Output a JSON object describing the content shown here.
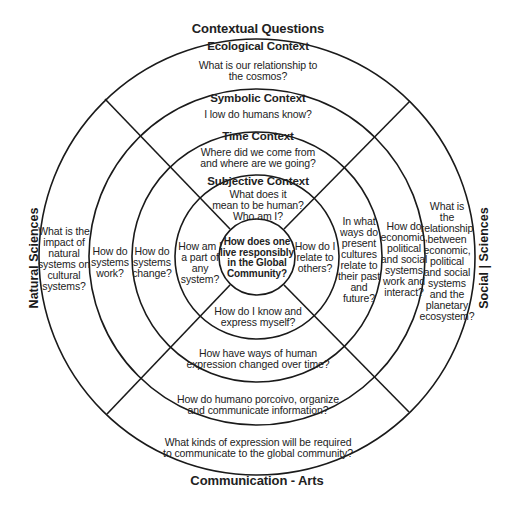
{
  "diagram": {
    "outer_labels": {
      "top": "Contextual Questions",
      "bottom": "Communication - Arts",
      "left": "Natural Sciences",
      "right": "Social | Sciences"
    },
    "rings": {
      "ecological": {
        "title": "Ecological Context",
        "top_question": "What is our relationship to\nthe cosmos?",
        "left_question": "What is the\nimpact of\nnatural\nsystems on\ncultural\nsystems?",
        "right_question": "What is\nthe\nrelationship\nbetween\neconomic,\npolitical\nand social\nsystems\nand the\nplanetary\necosystem?",
        "bottom_question": "What kinds of expression will be required\nto communicate to the global community?"
      },
      "symbolic": {
        "title": "Symbolic Context",
        "top_question": "I low do humans know?",
        "left_question": "How do\nsystems\nwork?",
        "right_question": "How do\neconomic,\npolitical\nand social\nsystems\nwork and\ninteract?",
        "bottom_question": "How do humano porcoivo, organize\nand communicate information?"
      },
      "time": {
        "title": "Time Context",
        "top_question": "Where did we come from\nand where are we going?",
        "left_question": "How do\nsystems\nchange?",
        "right_question": "In what\nways do\npresent\ncultures\nrelate to\ntheir past\nand\nfuture?",
        "bottom_question": "How have ways of human\nexpression changed over time?"
      },
      "subjective": {
        "title": "Subjective Context",
        "top_question": "What does it\nmean to be human?\nWho am I?",
        "left_question": "How am I\na part of\nany\nsystem?",
        "right_question": "How do I\nrelate to\nothers?",
        "bottom_question": "How do I know and\nexpress myself?"
      }
    },
    "center": {
      "question": "How does one\nlive responsibly\nin the Global\nCommunity?"
    },
    "geometry": {
      "center": [
        257,
        257
      ],
      "radii": [
        38,
        82,
        125,
        167,
        217
      ],
      "stroke_color": "#1a1a1a"
    }
  }
}
